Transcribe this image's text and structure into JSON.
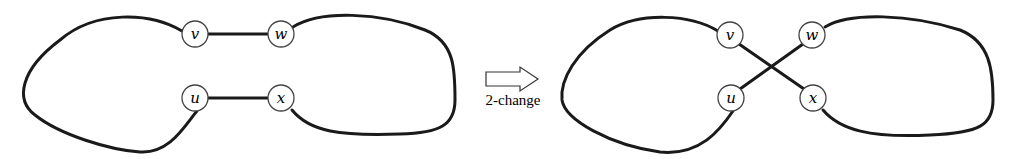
{
  "diagram": {
    "type": "2-opt move illustration",
    "before": {
      "nodes": [
        {
          "id": "v",
          "label": "v"
        },
        {
          "id": "w",
          "label": "w"
        },
        {
          "id": "u",
          "label": "u"
        },
        {
          "id": "x",
          "label": "x"
        }
      ],
      "edges": [
        [
          "v",
          "w"
        ],
        [
          "u",
          "x"
        ]
      ]
    },
    "arrow": {
      "label": "2-change"
    },
    "after": {
      "nodes": [
        {
          "id": "v",
          "label": "v"
        },
        {
          "id": "w",
          "label": "w"
        },
        {
          "id": "u",
          "label": "u"
        },
        {
          "id": "x",
          "label": "x"
        }
      ],
      "edges": [
        [
          "v",
          "x"
        ],
        [
          "u",
          "w"
        ]
      ]
    }
  }
}
